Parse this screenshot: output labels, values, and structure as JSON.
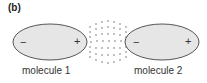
{
  "panel_label": "(b)",
  "molecules": [
    {
      "label": "molecule 1",
      "left_charge": "−",
      "right_charge": "+"
    },
    {
      "label": "molecule 2",
      "left_charge": "−",
      "right_charge": "+"
    }
  ],
  "colors": {
    "ellipse_fill": "#e6e6e6",
    "ellipse_stroke": "#555555",
    "dots": "#555555",
    "text": "#333333"
  }
}
